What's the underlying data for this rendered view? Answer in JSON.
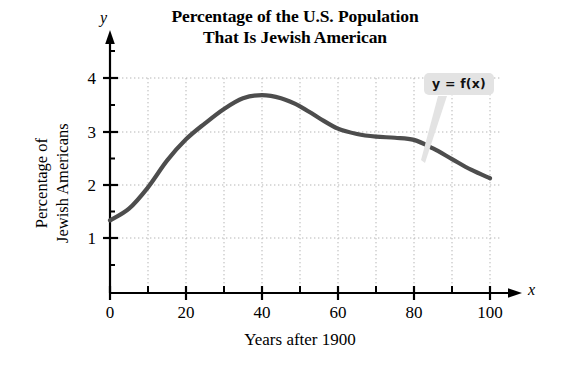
{
  "chart_data": {
    "type": "line",
    "title": "Percentage of the U.S. Population That Is Jewish American",
    "title_line1": "Percentage of the U.S. Population",
    "title_line2": "That Is Jewish American",
    "xlabel": "Years after 1900",
    "ylabel": "Percentage of Jewish Americans",
    "ylabel_line1": "Percentage of",
    "ylabel_line2": "Jewish Americans",
    "x_axis_variable": "x",
    "y_axis_variable": "y",
    "curve_label": "y = f(x)",
    "xlim": [
      0,
      104
    ],
    "ylim": [
      0,
      4.35
    ],
    "xticks": [
      0,
      20,
      40,
      60,
      80,
      100
    ],
    "xtick_labels": [
      "0",
      "20",
      "40",
      "60",
      "80",
      "100"
    ],
    "x_minor_ticks": [
      10,
      30,
      50,
      70,
      90
    ],
    "yticks": [
      1,
      2,
      3,
      4
    ],
    "ytick_labels": [
      "1",
      "2",
      "3",
      "4"
    ],
    "grid": true,
    "grid_style": "dotted",
    "grid_x_values": [
      10,
      20,
      30,
      40,
      50,
      60,
      70,
      80,
      90,
      100
    ],
    "grid_y_values": [
      1,
      2,
      3,
      4
    ],
    "legend": "none",
    "line_color": "#4d4d4d",
    "line_width": 4,
    "x": [
      0,
      5,
      10,
      15,
      20,
      25,
      30,
      35,
      40,
      45,
      50,
      55,
      60,
      65,
      70,
      75,
      80,
      85,
      90,
      95,
      100
    ],
    "y": [
      1.33,
      1.55,
      1.95,
      2.45,
      2.85,
      3.15,
      3.42,
      3.62,
      3.68,
      3.62,
      3.47,
      3.25,
      3.05,
      2.95,
      2.9,
      2.88,
      2.84,
      2.68,
      2.48,
      2.28,
      2.12
    ],
    "series": [
      {
        "name": "y = f(x)",
        "values": [
          1.33,
          1.55,
          1.95,
          2.45,
          2.85,
          3.15,
          3.42,
          3.62,
          3.68,
          3.62,
          3.47,
          3.25,
          3.05,
          2.95,
          2.9,
          2.88,
          2.84,
          2.68,
          2.48,
          2.28,
          2.12
        ]
      }
    ],
    "annotations": [
      {
        "text": "y = f(x)",
        "type": "callout",
        "points_to_x": 87,
        "points_to_y": 2.6
      }
    ]
  },
  "colors": {
    "curve": "#4d4d4d",
    "axis": "#000000",
    "grid": "#b5b5b5",
    "callout_bg": "#e3e3e3",
    "callout_text": "#111111",
    "background": "#ffffff"
  }
}
